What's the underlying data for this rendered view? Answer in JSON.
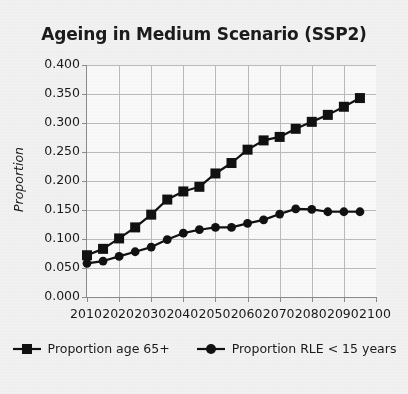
{
  "chart_data": {
    "type": "line",
    "title": "Ageing in Medium Scenario (SSP2)",
    "xlabel": "",
    "ylabel": "Proportion",
    "xlim": [
      2010,
      2100
    ],
    "ylim": [
      0.0,
      0.4
    ],
    "grid": true,
    "legend_position": "bottom",
    "xticks": [
      "2010",
      "2020",
      "2030",
      "2040",
      "2050",
      "2060",
      "2070",
      "2080",
      "2090",
      "2100"
    ],
    "yticks": [
      "0.000",
      "0.050",
      "0.100",
      "0.150",
      "0.200",
      "0.250",
      "0.300",
      "0.350",
      "0.400"
    ],
    "x": [
      2010,
      2015,
      2020,
      2025,
      2030,
      2035,
      2040,
      2045,
      2050,
      2055,
      2060,
      2065,
      2070,
      2075,
      2080,
      2085,
      2090,
      2095
    ],
    "series": [
      {
        "name": "Proportion age 65+",
        "marker": "square",
        "color": "#111111",
        "values": [
          0.072,
          0.083,
          0.101,
          0.12,
          0.142,
          0.168,
          0.182,
          0.19,
          0.213,
          0.231,
          0.254,
          0.27,
          0.276,
          0.29,
          0.302,
          0.314,
          0.328,
          0.343
        ]
      },
      {
        "name": "Proportion RLE < 15 years",
        "marker": "circle",
        "color": "#111111",
        "values": [
          0.058,
          0.062,
          0.07,
          0.078,
          0.086,
          0.099,
          0.11,
          0.116,
          0.12,
          0.12,
          0.127,
          0.133,
          0.143,
          0.152,
          0.151,
          0.147,
          0.147,
          0.147
        ]
      }
    ]
  },
  "legend": {
    "entries": [
      {
        "label": "Proportion age 65+",
        "marker": "square-marker-icon"
      },
      {
        "label": "Proportion RLE < 15 years",
        "marker": "circle-marker-icon"
      }
    ]
  },
  "colors": {
    "ink": "#111111",
    "axis": "#8c8c8c",
    "grid": "#bcbcbc",
    "background": "#f3f3f3",
    "plot_background": "#fbfbfb"
  }
}
